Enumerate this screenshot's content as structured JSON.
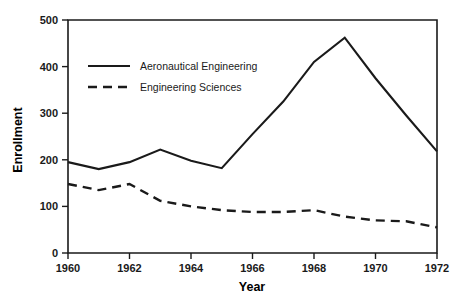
{
  "chart_data": {
    "type": "line",
    "title": "",
    "subtitle": "",
    "xlabel": "Year",
    "ylabel": "Enrollment",
    "x": [
      1960,
      1961,
      1962,
      1963,
      1964,
      1965,
      1966,
      1967,
      1968,
      1969,
      1970,
      1971,
      1972
    ],
    "xlim": [
      1960,
      1972
    ],
    "ylim": [
      0,
      500
    ],
    "xticks": [
      1960,
      1962,
      1964,
      1966,
      1968,
      1970,
      1972
    ],
    "xticklabels": [
      "1960",
      "1962",
      "1964",
      "1966",
      "1968",
      "1970",
      "1972"
    ],
    "yticks": [
      0,
      100,
      200,
      300,
      400,
      500
    ],
    "yticklabels": [
      "0",
      "100",
      "200",
      "300",
      "400",
      "500"
    ],
    "grid": false,
    "legend_position": "upper-left-inside",
    "series": [
      {
        "name": "Aeronautical Engineering",
        "style": "solid",
        "color": "#1a1a1a",
        "values": [
          195,
          180,
          195,
          222,
          198,
          182,
          255,
          325,
          410,
          462,
          375,
          295,
          218
        ]
      },
      {
        "name": "Engineering Sciences",
        "style": "dashed",
        "color": "#1a1a1a",
        "values": [
          148,
          135,
          148,
          112,
          100,
          92,
          88,
          88,
          92,
          78,
          70,
          68,
          55
        ]
      }
    ]
  },
  "legend": {
    "entries": [
      {
        "label": "Aeronautical Engineering",
        "style": "solid"
      },
      {
        "label": "Engineering Sciences",
        "style": "dashed"
      }
    ]
  },
  "axes": {
    "y_title": "Enrollment",
    "x_title": "Year"
  }
}
